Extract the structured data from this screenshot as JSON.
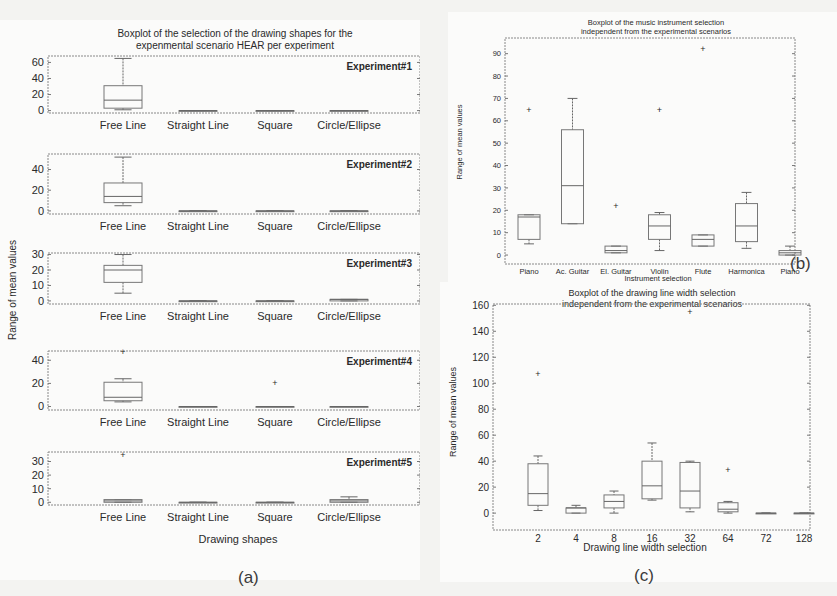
{
  "captions": {
    "a": "(a)",
    "b": "(b)",
    "c": "(c)"
  },
  "chart_data": [
    {
      "id": "a",
      "type": "boxplot",
      "title": "Boxplot of the selection of the drawing shapes for the experimental scenario HEAR per experiment",
      "title_lines": [
        "Boxplot of the selection of the drawing shapes for the",
        "expenmental scenario HEAR per experiment"
      ],
      "xlabel": "Drawing shapes",
      "ylabel": "Range of mean values",
      "categories": [
        "Free Line",
        "Straight Line",
        "Square",
        "Circle/Ellipse"
      ],
      "subplots": [
        {
          "label": "Experiment#1",
          "ylim": [
            -3,
            68
          ],
          "yticks": [
            0,
            20,
            40,
            60
          ],
          "boxes": [
            {
              "min": 1,
              "q1": 3,
              "median": 13,
              "q3": 31,
              "max": 65,
              "outliers": []
            },
            {
              "min": 0,
              "q1": 0,
              "median": 0,
              "q3": 0,
              "max": 0,
              "outliers": []
            },
            {
              "min": 0,
              "q1": 0,
              "median": 0,
              "q3": 0,
              "max": 0,
              "outliers": []
            },
            {
              "min": 0,
              "q1": 0,
              "median": 0,
              "q3": 0,
              "max": 0,
              "outliers": []
            }
          ]
        },
        {
          "label": "Experiment#2",
          "ylim": [
            -3,
            55
          ],
          "yticks": [
            0,
            20,
            40
          ],
          "boxes": [
            {
              "min": 5,
              "q1": 8,
              "median": 14,
              "q3": 27,
              "max": 52,
              "outliers": []
            },
            {
              "min": 0,
              "q1": 0,
              "median": 0,
              "q3": 0,
              "max": 0,
              "outliers": []
            },
            {
              "min": 0,
              "q1": 0,
              "median": 0,
              "q3": 0,
              "max": 0,
              "outliers": []
            },
            {
              "min": 0,
              "q1": 0,
              "median": 0,
              "q3": 0,
              "max": 0,
              "outliers": []
            }
          ]
        },
        {
          "label": "Experiment#3",
          "ylim": [
            -2,
            31
          ],
          "yticks": [
            0,
            10,
            20,
            30
          ],
          "boxes": [
            {
              "min": 5,
              "q1": 12,
              "median": 20,
              "q3": 23,
              "max": 30,
              "outliers": []
            },
            {
              "min": 0,
              "q1": 0,
              "median": 0,
              "q3": 0,
              "max": 0,
              "outliers": []
            },
            {
              "min": 0,
              "q1": 0,
              "median": 0,
              "q3": 0,
              "max": 0,
              "outliers": []
            },
            {
              "min": 0,
              "q1": 0,
              "median": 1,
              "q3": 1,
              "max": 1,
              "outliers": []
            }
          ]
        },
        {
          "label": "Experiment#4",
          "ylim": [
            -3,
            48
          ],
          "yticks": [
            0,
            20,
            40
          ],
          "boxes": [
            {
              "min": 4,
              "q1": 5,
              "median": 8,
              "q3": 21,
              "max": 24,
              "outliers": [
                47
              ]
            },
            {
              "min": 0,
              "q1": 0,
              "median": 0,
              "q3": 0,
              "max": 0,
              "outliers": []
            },
            {
              "min": 0,
              "q1": 0,
              "median": 0,
              "q3": 0,
              "max": 0,
              "outliers": [
                20
              ]
            },
            {
              "min": 0,
              "q1": 0,
              "median": 0,
              "q3": 0,
              "max": 0,
              "outliers": []
            }
          ]
        },
        {
          "label": "Experiment#5",
          "ylim": [
            -2,
            37
          ],
          "yticks": [
            0,
            10,
            20,
            30
          ],
          "boxes": [
            {
              "min": 0,
              "q1": 0,
              "median": 1,
              "q3": 2,
              "max": 2,
              "outliers": [
                35
              ]
            },
            {
              "min": 0,
              "q1": 0,
              "median": 0,
              "q3": 0,
              "max": 0,
              "outliers": []
            },
            {
              "min": 0,
              "q1": 0,
              "median": 0,
              "q3": 0,
              "max": 0,
              "outliers": []
            },
            {
              "min": 0,
              "q1": 0,
              "median": 1,
              "q3": 2,
              "max": 4,
              "outliers": []
            }
          ]
        }
      ]
    },
    {
      "id": "b",
      "type": "boxplot",
      "title": "Boxplot of the music instrument selection independent from the experimental scenarios",
      "title_lines": [
        "Boxplot of the music instrument selection",
        "independent from the experimental scenarios"
      ],
      "xlabel": "Instrument selection",
      "ylabel": "Range of mean values",
      "ylim": [
        -4,
        97
      ],
      "yticks": [
        0,
        10,
        20,
        30,
        40,
        50,
        60,
        70,
        80,
        90
      ],
      "categories": [
        "Piano",
        "Ac. Guitar",
        "El. Guitar",
        "Violin",
        "Flute",
        "Harmonica",
        "Piano"
      ],
      "boxes": [
        {
          "min": 5,
          "q1": 7,
          "median": 17,
          "q3": 18,
          "max": 18,
          "outliers": [
            65
          ]
        },
        {
          "min": 14,
          "q1": 14,
          "median": 31,
          "q3": 56,
          "max": 70,
          "outliers": []
        },
        {
          "min": 1,
          "q1": 1,
          "median": 2,
          "q3": 4,
          "max": 4,
          "outliers": [
            22
          ]
        },
        {
          "min": 2,
          "q1": 7,
          "median": 13,
          "q3": 18,
          "max": 19,
          "outliers": [
            65
          ]
        },
        {
          "min": 4,
          "q1": 4,
          "median": 7,
          "q3": 9,
          "max": 9,
          "outliers": [
            92
          ]
        },
        {
          "min": 3,
          "q1": 6,
          "median": 13,
          "q3": 23,
          "max": 28,
          "outliers": []
        },
        {
          "min": 0,
          "q1": 0,
          "median": 1,
          "q3": 2,
          "max": 4,
          "outliers": []
        }
      ]
    },
    {
      "id": "c",
      "type": "boxplot",
      "title": "Boxplot of the drawing line width selection independent from the experimental scenarios",
      "title_lines": [
        "Boxplot of the  drawing line width selection",
        "independent from the experimental scenarios"
      ],
      "xlabel": "Drawing line width selection",
      "ylabel": "Range of mean values",
      "ylim": [
        -13,
        161
      ],
      "yticks": [
        0,
        20,
        40,
        60,
        80,
        100,
        120,
        140,
        160
      ],
      "categories": [
        "2",
        "4",
        "8",
        "16",
        "32",
        "64",
        "72",
        "128"
      ],
      "boxes": [
        {
          "min": 2,
          "q1": 6,
          "median": 15,
          "q3": 38,
          "max": 44,
          "outliers": [
            107
          ]
        },
        {
          "min": 0,
          "q1": 0,
          "median": 4,
          "q3": 4,
          "max": 6,
          "outliers": []
        },
        {
          "min": 0,
          "q1": 4,
          "median": 9,
          "q3": 14,
          "max": 17,
          "outliers": []
        },
        {
          "min": 10,
          "q1": 11,
          "median": 21,
          "q3": 40,
          "max": 54,
          "outliers": []
        },
        {
          "min": 1,
          "q1": 4,
          "median": 17,
          "q3": 39,
          "max": 40,
          "outliers": [
            155
          ]
        },
        {
          "min": 0,
          "q1": 1,
          "median": 3,
          "q3": 8,
          "max": 9,
          "outliers": [
            33
          ]
        },
        {
          "min": 0,
          "q1": 0,
          "median": 0,
          "q3": 0,
          "max": 0,
          "outliers": []
        },
        {
          "min": 0,
          "q1": 0,
          "median": 0,
          "q3": 0,
          "max": 0,
          "outliers": []
        }
      ]
    }
  ]
}
